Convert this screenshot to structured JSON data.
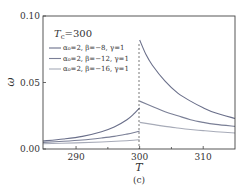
{
  "chart_data": {
    "type": "line",
    "title": "",
    "caption": "(c)",
    "xlabel": "T",
    "ylabel": "ω",
    "xlim": [
      284.8,
      315
    ],
    "ylim": [
      0.0,
      0.1
    ],
    "x_ticks": [
      290,
      300,
      310
    ],
    "x_minor_ticks": [
      295,
      305
    ],
    "y_ticks": [
      0.0,
      0.05,
      0.1
    ],
    "y_tick_labels": [
      "0.00",
      "0.05",
      "0.10"
    ],
    "x_tick_labels": [
      "290",
      "300",
      "310"
    ],
    "grid": false,
    "annotation": "T_c=300",
    "vertical_dashed_line_at": 300,
    "legend_position": "upper-left",
    "series": [
      {
        "name": "α0=2, β=−8, γ=1",
        "color": "#6a6f8a",
        "below_Tc": {
          "x": [
            284.8,
            288,
            291,
            294,
            296,
            298,
            299,
            300
          ],
          "y": [
            0.006,
            0.0075,
            0.0095,
            0.013,
            0.0165,
            0.022,
            0.026,
            0.031
          ]
        },
        "above_Tc": {
          "x": [
            300,
            301,
            302,
            304,
            306,
            308,
            310,
            312,
            315
          ],
          "y": [
            0.082,
            0.071,
            0.063,
            0.051,
            0.042,
            0.036,
            0.031,
            0.027,
            0.023
          ]
        }
      },
      {
        "name": "α0=2, β=−12, γ=1",
        "color": "#7a7f96",
        "below_Tc": {
          "x": [
            284.8,
            288,
            291,
            294,
            296,
            298,
            299,
            300
          ],
          "y": [
            0.005,
            0.0058,
            0.0068,
            0.0083,
            0.0095,
            0.0112,
            0.0122,
            0.0135
          ]
        },
        "above_Tc": {
          "x": [
            300,
            302,
            304,
            306,
            308,
            310,
            312,
            315
          ],
          "y": [
            0.036,
            0.032,
            0.028,
            0.025,
            0.022,
            0.02,
            0.0185,
            0.017
          ]
        }
      },
      {
        "name": "α0=2, β=−16, γ=1",
        "color": "#a7abb8",
        "below_Tc": {
          "x": [
            284.8,
            290,
            294,
            297,
            299,
            300
          ],
          "y": [
            0.004,
            0.0046,
            0.0053,
            0.006,
            0.0066,
            0.007
          ]
        },
        "above_Tc": {
          "x": [
            300,
            302,
            304,
            306,
            308,
            310,
            312,
            315
          ],
          "y": [
            0.02,
            0.0185,
            0.017,
            0.0158,
            0.0147,
            0.0138,
            0.013,
            0.012
          ]
        }
      }
    ]
  },
  "legend": {
    "title": "T",
    "title_sub": "c",
    "title_value": "=300",
    "items": [
      {
        "label": "α₀=2, β=−8, γ=1"
      },
      {
        "label": "α₀=2, β=−12, γ=1"
      },
      {
        "label": "α₀=2, β=−16, γ=1"
      }
    ]
  },
  "axes": {
    "xlabel": "T",
    "ylabel": "ω",
    "caption": "(c)"
  }
}
